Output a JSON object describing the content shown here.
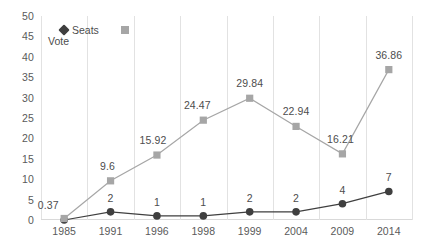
{
  "chart_data": {
    "type": "line",
    "title": "",
    "xlabel": "",
    "ylabel": "",
    "categories": [
      "1985",
      "1991",
      "1996",
      "1998",
      "1999",
      "2004",
      "2009",
      "2014"
    ],
    "ylim": [
      0,
      50
    ],
    "yticks": [
      0,
      5,
      10,
      15,
      20,
      25,
      30,
      35,
      40,
      45,
      50
    ],
    "ytick_labels": [
      "0",
      "5",
      "10",
      "15",
      "20",
      "25",
      "30",
      "35",
      "40",
      "45",
      "50"
    ],
    "grid": "vertical",
    "legend_position": "top-left",
    "series": [
      {
        "name": "Seats",
        "marker": "circle",
        "color": "#3f3f3f",
        "values": [
          0,
          2,
          1,
          1,
          2,
          2,
          4,
          7
        ],
        "labels": [
          "",
          "2",
          "1",
          "1",
          "2",
          "2",
          "4",
          "7"
        ]
      },
      {
        "name": "Vote",
        "marker": "square",
        "color": "#a6a6a6",
        "values": [
          0.37,
          9.6,
          15.92,
          24.47,
          29.84,
          22.94,
          16.21,
          36.86
        ],
        "labels": [
          "0.37",
          "9.6",
          "15.92",
          "24.47",
          "29.84",
          "22.94",
          "16.21",
          "36.86"
        ]
      }
    ]
  },
  "legend": {
    "seats_label": "Seats",
    "vote_label": "Vote"
  }
}
